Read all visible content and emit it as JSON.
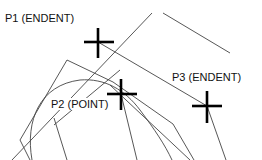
{
  "diagram": {
    "background": "#ffffff",
    "line_color": "#444444",
    "marker_color": "#000000",
    "points": [
      {
        "id": "p1",
        "label": "P1 (ENDENT)",
        "x": 98,
        "y": 42,
        "label_x": 5,
        "label_y": 12
      },
      {
        "id": "p2",
        "label": "P2 (POINT)",
        "x": 121,
        "y": 94,
        "label_x": 51,
        "label_y": 98
      },
      {
        "id": "p3",
        "label": "P3 (ENDENT)",
        "x": 207,
        "y": 106,
        "label_x": 172,
        "label_y": 71
      }
    ]
  }
}
